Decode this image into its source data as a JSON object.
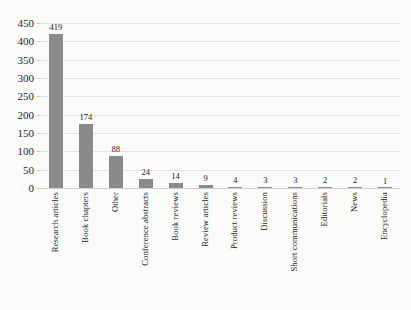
{
  "chart_data": {
    "type": "bar",
    "title": "",
    "xlabel": "",
    "ylabel": "",
    "categories": [
      "Research articles",
      "Book chapters",
      "Other",
      "Conference abstracts",
      "Book reviews",
      "Review articles",
      "Product reviews",
      "Discussion",
      "Short communications",
      "Editorials",
      "News",
      "Encyclopedia"
    ],
    "values": [
      419,
      174,
      88,
      24,
      14,
      9,
      4,
      3,
      3,
      2,
      2,
      1
    ],
    "data_labels": [
      "419",
      "174",
      "88",
      "24",
      "14",
      "9",
      "4",
      "3",
      "3",
      "2",
      "2",
      "1"
    ],
    "ylim": [
      0,
      450
    ],
    "ytick_step": 50,
    "ytick_labels": [
      "450",
      "400",
      "350",
      "300",
      "250",
      "200",
      "150",
      "100",
      "50",
      "0"
    ],
    "ytick_values": [
      450,
      400,
      350,
      300,
      250,
      200,
      150,
      100,
      50,
      0
    ],
    "grid": true,
    "grid_axis": "y",
    "legend": false,
    "legend_position": "none",
    "xtick_rotation": 90,
    "bar_color": "#8a8a8a",
    "grid_color": "#e2e2e2",
    "axis_color": "#cfcfcf",
    "background_color": "#fbfbfa",
    "text_color": "#1d1d1d"
  }
}
